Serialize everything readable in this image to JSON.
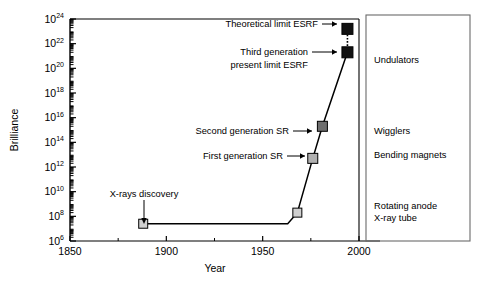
{
  "chart_data": {
    "type": "line",
    "title": "",
    "xlabel": "Year",
    "ylabel": "Brilliance",
    "xlim": [
      1850,
      2000
    ],
    "ylim_log10": [
      6,
      24
    ],
    "xticks": [
      1850,
      1900,
      1950,
      2000
    ],
    "xticklabels": [
      "1850",
      "1900",
      "1950",
      "2000"
    ],
    "x_minor_step": 25,
    "yticks_log10": [
      6,
      8,
      10,
      12,
      14,
      16,
      18,
      20,
      22,
      24
    ],
    "yticklabels": [
      "10^6",
      "10^8",
      "10^10",
      "10^12",
      "10^14",
      "10^16",
      "10^18",
      "10^20",
      "10^22",
      "10^24"
    ],
    "y_mantissa": "10",
    "y_exponents": [
      "6",
      "8",
      "10",
      "12",
      "14",
      "16",
      "18",
      "20",
      "22",
      "24"
    ],
    "grid": false,
    "legend_position": "right-box",
    "series": [
      {
        "name": "Brilliance evolution",
        "x": [
          1888,
          1963,
          1968,
          1976,
          1981,
          1994
        ],
        "y_log10": [
          7.4,
          7.4,
          8.3,
          12.7,
          15.3,
          21.3
        ],
        "style": "solid"
      },
      {
        "name": "Projection to theoretical limit",
        "x": [
          1994,
          1994
        ],
        "y_log10": [
          21.3,
          23.2
        ],
        "style": "dotted"
      }
    ],
    "markers": [
      {
        "label": "X-rays discovery",
        "x": 1888,
        "y_log10": 7.4,
        "color": "#d0d0d0",
        "size": 9,
        "shape": "square"
      },
      {
        "label": "pre-synchrotron step",
        "x": 1968,
        "y_log10": 8.3,
        "color": "#d0d0d0",
        "size": 9,
        "shape": "square"
      },
      {
        "label": "First generation SR",
        "x": 1976,
        "y_log10": 12.7,
        "color": "#b0b0b0",
        "size": 10,
        "shape": "square"
      },
      {
        "label": "Second generation SR",
        "x": 1981,
        "y_log10": 15.3,
        "color": "#6e6e6e",
        "size": 10,
        "shape": "square"
      },
      {
        "label": "Third generation present limit ESRF",
        "x": 1994,
        "y_log10": 21.3,
        "color": "#111111",
        "size": 11,
        "shape": "square"
      },
      {
        "label": "Theoretical limit ESRF",
        "x": 1994,
        "y_log10": 23.2,
        "color": "#111111",
        "size": 11,
        "shape": "square"
      }
    ],
    "annotations": [
      {
        "name": "theoretical-limit-esrf",
        "text": "Theoretical limit ESRF",
        "arrow": "right"
      },
      {
        "name": "third-generation-esrf",
        "text_line1": "Third generation",
        "text_line2": "present limit ESRF",
        "arrow": "right"
      },
      {
        "name": "second-generation-sr",
        "text": "Second generation SR",
        "arrow": "right"
      },
      {
        "name": "first-generation-sr",
        "text": "First generation SR",
        "arrow": "right"
      },
      {
        "name": "x-rays-discovery",
        "text": "X-rays discovery",
        "arrow": "down"
      }
    ]
  },
  "legend_box": {
    "items": [
      {
        "name": "undulators",
        "text": "Undulators"
      },
      {
        "name": "wigglers",
        "text": "Wigglers"
      },
      {
        "name": "bending-magnets",
        "text": "Bending magnets"
      },
      {
        "name": "rotating-anode",
        "line1": "Rotating anode",
        "line2": "X-ray tube"
      }
    ]
  }
}
